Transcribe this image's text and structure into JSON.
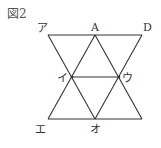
{
  "figure": {
    "title": "図2",
    "labels": {
      "a": "ア",
      "A": "A",
      "D": "D",
      "i": "イ",
      "u": "ウ",
      "e": "エ",
      "o": "オ"
    },
    "points": {
      "ア": [
        48,
        35
      ],
      "A": [
        95,
        35
      ],
      "D": [
        142,
        35
      ],
      "イ": [
        72,
        77
      ],
      "ウ": [
        119,
        77
      ],
      "エ": [
        48,
        119
      ],
      "オ": [
        95,
        119
      ],
      "BR": [
        142,
        119
      ]
    },
    "segments": [
      [
        "ア",
        "D"
      ],
      [
        "エ",
        "BR"
      ],
      [
        "イ",
        "ウ"
      ],
      [
        "ア",
        "オ"
      ],
      [
        "A",
        "エ"
      ],
      [
        "A",
        "BR"
      ],
      [
        "D",
        "オ"
      ]
    ],
    "line_color": "#333333"
  }
}
